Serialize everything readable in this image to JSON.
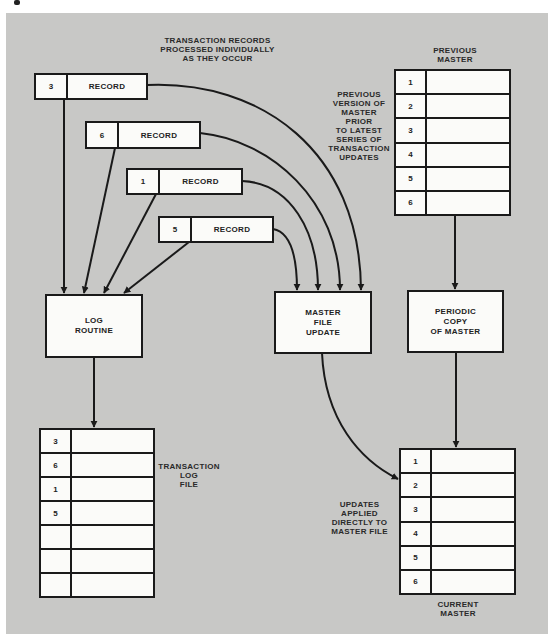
{
  "captions": {
    "transaction_records": "TRANSACTION RECORDS\nPROCESSED INDIVIDUALLY\nAS THEY OCCUR",
    "previous_master_title": "PREVIOUS\nMASTER",
    "previous_version_note": "PREVIOUS\nVERSION OF\nMASTER PRIOR\nTO LATEST\nSERIES OF\nTRANSACTION\nUPDATES",
    "transaction_log_file": "TRANSACTION\nLOG\nFILE",
    "updates_applied_note": "UPDATES APPLIED\nDIRECTLY TO\nMASTER FILE",
    "current_master_title": "CURRENT\nMASTER"
  },
  "records": [
    {
      "id": "3",
      "label": "RECORD"
    },
    {
      "id": "6",
      "label": "RECORD"
    },
    {
      "id": "1",
      "label": "RECORD"
    },
    {
      "id": "5",
      "label": "RECORD"
    }
  ],
  "processes": {
    "log_routine": "LOG\nROUTINE",
    "master_file_update": "MASTER\nFILE\nUPDATE",
    "periodic_copy": "PERIODIC\nCOPY\nOF MASTER"
  },
  "previous_master_rows": [
    "1",
    "2",
    "3",
    "4",
    "5",
    "6"
  ],
  "current_master_rows": [
    "1",
    "2",
    "3",
    "4",
    "5",
    "6"
  ],
  "transaction_log_rows": [
    "3",
    "6",
    "1",
    "5",
    "",
    "",
    ""
  ],
  "colors": {
    "background_panel": "#c8c8c6",
    "box_fill": "#fbfbf9",
    "line": "#1a1a1a"
  }
}
